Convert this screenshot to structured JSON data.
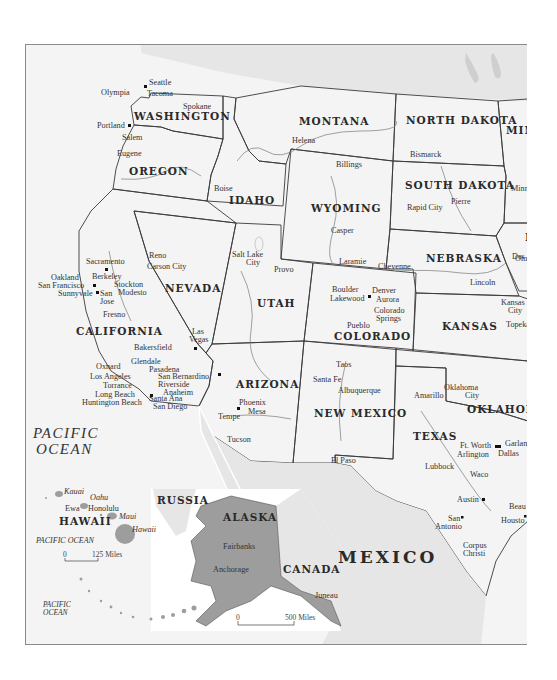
{
  "map": {
    "title": "Western United States",
    "colors": {
      "background": "#ffffff",
      "ocean": "#f4f4f4",
      "state_light": "#c4c4c4",
      "state_medium": "#b0b0b0",
      "state_dark": "#9a9a9a",
      "foreign": "#e4e4e4",
      "border": "#3a3a3a",
      "river": "#7a7a7a"
    },
    "states": [
      {
        "name": "WASHINGTON",
        "shade": "dark"
      },
      {
        "name": "OREGON",
        "shade": "light"
      },
      {
        "name": "CALIFORNIA",
        "shade": "light"
      },
      {
        "name": "IDAHO",
        "shade": "light"
      },
      {
        "name": "NEVADA",
        "shade": "medium"
      },
      {
        "name": "MONTANA",
        "shade": "light"
      },
      {
        "name": "WYOMING",
        "shade": "light"
      },
      {
        "name": "UTAH",
        "shade": "dark"
      },
      {
        "name": "ARIZONA",
        "shade": "light"
      },
      {
        "name": "COLORADO",
        "shade": "light"
      },
      {
        "name": "NEW MEXICO",
        "shade": "medium"
      },
      {
        "name": "NORTH DAKOTA",
        "shade": "light"
      },
      {
        "name": "SOUTH DAKOTA",
        "shade": "light"
      },
      {
        "name": "NEBRASKA",
        "shade": "dark"
      },
      {
        "name": "KANSAS",
        "shade": "medium"
      },
      {
        "name": "OKLAHOMA",
        "shade": "light"
      },
      {
        "name": "TEXAS",
        "shade": "dark"
      },
      {
        "name": "MIN",
        "shade": "dark"
      },
      {
        "name": "I",
        "shade": "medium"
      },
      {
        "name": "ALASKA",
        "shade": "dark"
      },
      {
        "name": "HAWAII",
        "shade": "dark"
      }
    ],
    "countries": [
      "MEXICO",
      "CANADA",
      "RUSSIA"
    ],
    "oceans": [
      "PACIFIC OCEAN",
      "PACIFIC OCEAN",
      "PACIFIC OCEAN"
    ],
    "cities": {
      "washington": [
        "Seattle",
        "Tacoma",
        "Olympia",
        "Spokane"
      ],
      "oregon": [
        "Portland",
        "Salem",
        "Eugene"
      ],
      "california": [
        "Sacramento",
        "Oakland",
        "Berkeley",
        "San Francisco",
        "Sunnyvale",
        "San Jose",
        "Stockton",
        "Modesto",
        "Fresno",
        "Bakersfield",
        "Oxnard",
        "Glendale",
        "Pasadena",
        "Los Angeles",
        "Torrance",
        "Long Beach",
        "Huntington Beach",
        "San Bernardino",
        "Riverside",
        "Anaheim",
        "Santa Ana",
        "San Diego"
      ],
      "idaho": [
        "Boise"
      ],
      "nevada": [
        "Reno",
        "Carson City",
        "Las Vegas"
      ],
      "montana": [
        "Helena",
        "Billings"
      ],
      "wyoming": [
        "Casper",
        "Laramie",
        "Cheyenne"
      ],
      "utah": [
        "Salt Lake City",
        "Provo"
      ],
      "arizona": [
        "Phoenix",
        "Mesa",
        "Tempe",
        "Tucson"
      ],
      "colorado": [
        "Boulder",
        "Denver",
        "Lakewood",
        "Aurora",
        "Colorado Springs",
        "Pueblo"
      ],
      "new_mexico": [
        "Taos",
        "Santa Fe",
        "Albuquerque"
      ],
      "north_dakota": [
        "Bismarck"
      ],
      "south_dakota": [
        "Rapid City",
        "Pierre"
      ],
      "nebraska": [
        "Lincoln",
        "Omaha"
      ],
      "kansas": [
        "Kansas City",
        "Topeka"
      ],
      "oklahoma": [
        "Oklahoma City"
      ],
      "texas": [
        "Amarillo",
        "El Paso",
        "Lubbock",
        "Ft. Worth",
        "Arlington",
        "Dallas",
        "Garland",
        "Waco",
        "Austin",
        "San Antonio",
        "Houston",
        "Beaumont",
        "Corpus Christi"
      ],
      "iowa": [
        "Des Moines"
      ],
      "minnesota": [
        "Minneapolis"
      ],
      "alaska": [
        "Fairbanks",
        "Anchorage",
        "Juneau"
      ],
      "hawaii": [
        "Kauai",
        "Oahu",
        "Ewa",
        "Honolulu",
        "Maui",
        "Hawaii"
      ]
    },
    "labels": {
      "seattle": "Seattle",
      "tacoma": "Tacoma",
      "olympia": "Olympia",
      "spokane": "Spokane",
      "portland": "Portland",
      "salem": "Salem",
      "eugene": "Eugene",
      "sacramento": "Sacramento",
      "oakland": "Oakland",
      "berkeley": "Berkeley",
      "san_francisco": "San Francisco",
      "sunnyvale": "Sunnyvale",
      "san": "San",
      "jose": "Jose",
      "stockton": "Stockton",
      "modesto": "Modesto",
      "fresno": "Fresno",
      "bakersfield": "Bakersfield",
      "oxnard": "Oxnard",
      "glendale": "Glendale",
      "pasadena": "Pasadena",
      "los_angeles": "Los Angeles",
      "torrance": "Torrance",
      "long_beach": "Long Beach",
      "huntington_beach": "Huntington Beach",
      "san_bernardino": "San Bernardino",
      "riverside": "Riverside",
      "anaheim": "Anaheim",
      "santa_ana": "Santa Ana",
      "san_diego": "San Diego",
      "boise": "Boise",
      "reno": "Reno",
      "carson_city": "Carson City",
      "las": "Las",
      "vegas": "Vegas",
      "helena": "Helena",
      "billings": "Billings",
      "casper": "Casper",
      "laramie": "Laramie",
      "cheyenne": "Cheyenne",
      "salt_lake": "Salt Lake",
      "city": "City",
      "provo": "Provo",
      "phoenix": "Phoenix",
      "mesa": "Mesa",
      "tempe": "Tempe",
      "tucson": "Tucson",
      "boulder": "Boulder",
      "denver": "Denver",
      "lakewood": "Lakewood",
      "aurora": "Aurora",
      "colorado": "Colorado",
      "springs": "Springs",
      "pueblo": "Pueblo",
      "taos": "Taos",
      "santa_fe": "Santa Fe",
      "albuquerque": "Albuquerque",
      "bismarck": "Bismarck",
      "rapid_city": "Rapid City",
      "pierre": "Pierre",
      "lincoln": "Lincoln",
      "omaha": "Oma",
      "des_moines": "Des",
      "minneapolis": "Minn",
      "kansas": "Kansas",
      "topeka": "Topeka",
      "oklahoma": "Oklahoma",
      "amarillo": "Amarillo",
      "el_paso": "El Paso",
      "lubbock": "Lubbock",
      "ft_worth": "Ft. Worth",
      "arlington": "Arlington",
      "dallas": "Dallas",
      "garland": "Garlan",
      "waco": "Waco",
      "austin": "Austin",
      "antonio": "Antonio",
      "houston": "Housto",
      "beaumont": "Beau",
      "corpus": "Corpus",
      "christi": "Christi",
      "fairbanks": "Fairbanks",
      "anchorage": "Anchorage",
      "juneau": "Juneau",
      "kauai": "Kauai",
      "oahu": "Oahu",
      "ewa": "Ewa",
      "honolulu": "Honolulu",
      "maui": "Maui",
      "hawaii_island": "Hawaii"
    },
    "state_labels": {
      "washington": "WASHINGTON",
      "oregon": "OREGON",
      "california": "CALIFORNIA",
      "idaho": "IDAHO",
      "nevada": "NEVADA",
      "montana": "MONTANA",
      "wyoming": "WYOMING",
      "utah": "UTAH",
      "arizona": "ARIZONA",
      "colorado": "COLORADO",
      "new_mexico": "NEW MEXICO",
      "north_dakota": "NORTH DAKOTA",
      "south_dakota": "SOUTH DAKOTA",
      "nebraska": "NEBRASKA",
      "kansas": "KANSAS",
      "oklahoma": "OKLAHOMA",
      "texas": "TEXAS",
      "minnesota": "MIN",
      "iowa": "I",
      "alaska": "ALASKA",
      "hawaii": "HAWAII"
    },
    "country_labels": {
      "mexico": "MEXICO",
      "canada": "CANADA",
      "russia": "RUSSIA"
    },
    "ocean_labels": {
      "pacific": "PACIFIC",
      "ocean": "OCEAN",
      "pacific_ocean": "PACIFIC OCEAN"
    },
    "scales": {
      "hawaii": {
        "start": "0",
        "end": "125 Miles"
      },
      "alaska": {
        "start": "0",
        "end": "500 Miles"
      }
    }
  }
}
